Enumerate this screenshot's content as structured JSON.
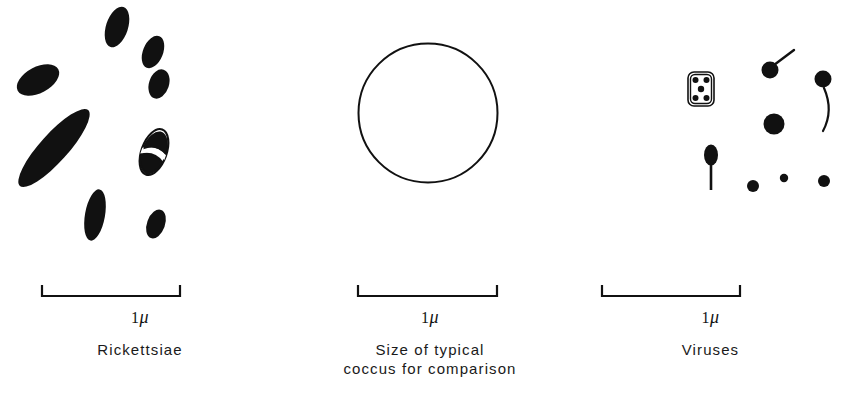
{
  "figure": {
    "background_color": "#ffffff",
    "ink_color": "#111111",
    "width": 841,
    "height": 397
  },
  "panels": [
    {
      "id": "rickettsiae",
      "caption_lines": [
        "Rickettsiae"
      ],
      "scale": {
        "label_value": "1",
        "label_unit": "μ",
        "bar_x_start": 42,
        "bar_x_end": 180,
        "bar_pixel_length": 138,
        "tick_direction": "up"
      },
      "specimen_type": "rod-shaped bacteria (filled black rods and ovals)",
      "specimen_count": 9,
      "specimens": [
        {
          "name": "rod-small-top",
          "cx": 117,
          "cy": 27,
          "rx": 11,
          "ry": 21,
          "angle": 18,
          "style": "filled"
        },
        {
          "name": "rod-upper-right",
          "cx": 153,
          "cy": 52,
          "rx": 10,
          "ry": 17,
          "angle": 22,
          "style": "filled"
        },
        {
          "name": "oval-right-upper",
          "cx": 159,
          "cy": 84,
          "rx": 10,
          "ry": 15,
          "angle": 18,
          "style": "filled"
        },
        {
          "name": "oval-left-upper",
          "cx": 34,
          "cy": 80,
          "rx": 13,
          "ry": 22,
          "angle": 62,
          "style": "filled"
        },
        {
          "name": "rod-long-diagonal",
          "cx": 52,
          "cy": 148,
          "rx": 14,
          "ry": 50,
          "angle": 42,
          "style": "filled"
        },
        {
          "name": "rod-lower-middle",
          "cx": 95,
          "cy": 215,
          "rx": 10,
          "ry": 26,
          "angle": 10,
          "style": "filled"
        },
        {
          "name": "oval-lower-right",
          "cx": 156,
          "cy": 224,
          "rx": 9,
          "ry": 15,
          "angle": 20,
          "style": "filled"
        },
        {
          "name": "dividing-cell",
          "cx": 154,
          "cy": 152,
          "rx": 12,
          "ry": 23,
          "angle": 20,
          "style": "dividing-outline"
        }
      ]
    },
    {
      "id": "coccus",
      "caption_lines": [
        "Size of typical",
        "coccus for comparison"
      ],
      "scale": {
        "label_value": "1",
        "label_unit": "μ",
        "bar_x_start": 78,
        "bar_x_end": 217,
        "bar_pixel_length": 139,
        "tick_direction": "up"
      },
      "specimen_type": "single unfilled circle outline",
      "specimen_count": 1,
      "specimens": [
        {
          "name": "coccus-outline-circle",
          "cx": 148,
          "cy": 113,
          "r": 70,
          "style": "outline"
        }
      ]
    },
    {
      "id": "viruses",
      "caption_lines": [
        "Viruses"
      ],
      "scale": {
        "label_value": "1",
        "label_unit": "μ",
        "bar_x_start": 22,
        "bar_x_end": 160,
        "bar_pixel_length": 138,
        "tick_direction": "up"
      },
      "specimen_type": "assorted virus particles (spheres, tailed phages, rectangular virion)",
      "specimen_count": 10,
      "specimens": [
        {
          "name": "rectangular-virion",
          "x": 108,
          "y": 72,
          "w": 26,
          "h": 34,
          "inner_dots": 5,
          "style": "outlined-rect-with-dots"
        },
        {
          "name": "phage-straight-tail",
          "cx": 190,
          "cy": 70,
          "r": 8,
          "tail": "straight-up-right",
          "style": "tailed"
        },
        {
          "name": "phage-curved-tail",
          "cx": 243,
          "cy": 79,
          "r": 8,
          "tail": "long-curved-down",
          "style": "tailed"
        },
        {
          "name": "large-sphere",
          "cx": 194,
          "cy": 124,
          "r": 10,
          "style": "filled"
        },
        {
          "name": "phage-vertical-tail",
          "cx": 131,
          "cy": 156,
          "rx": 7,
          "ry": 10,
          "tail": "straight-down",
          "style": "tailed"
        },
        {
          "name": "small-sphere-left",
          "cx": 173,
          "cy": 185,
          "r": 6,
          "style": "filled"
        },
        {
          "name": "small-sphere-mid",
          "cx": 203,
          "cy": 178,
          "r": 4,
          "style": "filled"
        },
        {
          "name": "small-sphere-right",
          "cx": 243,
          "cy": 180,
          "r": 6,
          "style": "filled"
        }
      ]
    }
  ]
}
